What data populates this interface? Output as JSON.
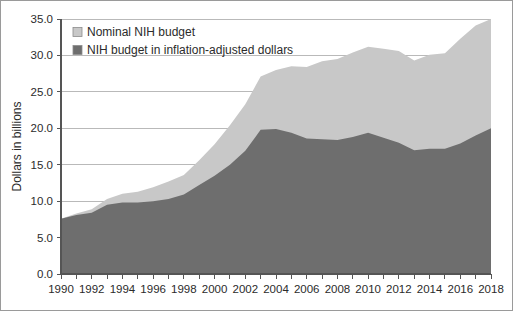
{
  "chart_data": {
    "type": "area",
    "title": "",
    "xlabel": "",
    "ylabel": "Dollars in billions",
    "xlim": [
      1990,
      2018
    ],
    "ylim": [
      0.0,
      35.0
    ],
    "ytick_step": 5.0,
    "grid": true,
    "legend_position": "top-left",
    "x": [
      1990,
      1991,
      1992,
      1993,
      1994,
      1995,
      1996,
      1997,
      1998,
      1999,
      2000,
      2001,
      2002,
      2003,
      2004,
      2005,
      2006,
      2007,
      2008,
      2009,
      2010,
      2011,
      2012,
      2013,
      2014,
      2015,
      2016,
      2017,
      2018
    ],
    "xticks": [
      1990,
      1991,
      1992,
      1993,
      1994,
      1995,
      1996,
      1997,
      1998,
      1999,
      2000,
      2001,
      2002,
      2003,
      2004,
      2005,
      2006,
      2007,
      2008,
      2009,
      2010,
      2011,
      2012,
      2013,
      2014,
      2015,
      2016,
      2017,
      2018
    ],
    "xtick_labels": [
      "1990",
      "",
      "1992",
      "",
      "1994",
      "",
      "1996",
      "",
      "1998",
      "",
      "2000",
      "",
      "2002",
      "",
      "2004",
      "",
      "2006",
      "",
      "2008",
      "",
      "2010",
      "",
      "2012",
      "",
      "2014",
      "",
      "2016",
      "",
      "2018"
    ],
    "ytick_labels": [
      "0.0",
      "5.0",
      "10.0",
      "15.0",
      "20.0",
      "25.0",
      "30.0",
      "35.0"
    ],
    "yticks": [
      0.0,
      5.0,
      10.0,
      15.0,
      20.0,
      25.0,
      30.0,
      35.0
    ],
    "series": [
      {
        "name": "Nominal NIH budget",
        "color": "#c8c8c8",
        "values": [
          7.6,
          8.3,
          8.9,
          10.3,
          11.0,
          11.3,
          11.9,
          12.7,
          13.6,
          15.6,
          17.8,
          20.4,
          23.3,
          27.1,
          28.0,
          28.5,
          28.4,
          29.2,
          29.5,
          30.4,
          31.2,
          30.9,
          30.6,
          29.3,
          30.1,
          30.3,
          32.3,
          34.1,
          35.0
        ]
      },
      {
        "name": "NIH budget in inflation-adjusted dollars",
        "color": "#6e6e6e",
        "values": [
          7.6,
          8.1,
          8.4,
          9.5,
          9.8,
          9.8,
          10.0,
          10.3,
          10.9,
          12.2,
          13.5,
          15.0,
          16.9,
          19.8,
          19.9,
          19.4,
          18.6,
          18.5,
          18.4,
          18.8,
          19.4,
          18.7,
          18.0,
          17.0,
          17.2,
          17.2,
          17.9,
          19.0,
          20.0
        ]
      }
    ],
    "legend": [
      {
        "label": "Nominal NIH budget",
        "color": "#c8c8c8"
      },
      {
        "label": "NIH budget in inflation-adjusted dollars",
        "color": "#6e6e6e"
      }
    ]
  }
}
